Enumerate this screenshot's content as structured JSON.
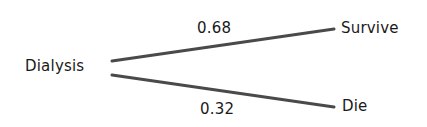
{
  "diagram": {
    "type": "decision-tree",
    "root": {
      "label": "Dialysis"
    },
    "branches": [
      {
        "probability": "0.68",
        "outcome": "Survive"
      },
      {
        "probability": "0.32",
        "outcome": "Die"
      }
    ],
    "line_color": "#4a4a4a",
    "text_color": "#1a1a1a"
  }
}
